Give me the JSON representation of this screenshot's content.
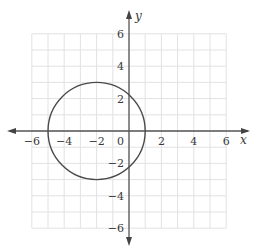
{
  "chart_data": {
    "type": "line",
    "title": "",
    "xlabel": "x",
    "ylabel": "y",
    "xlim": [
      -6,
      6
    ],
    "ylim": [
      -6,
      6
    ],
    "grid": true,
    "x_ticks": [
      -6,
      -4,
      -2,
      0,
      2,
      4,
      6
    ],
    "y_ticks": [
      -6,
      -4,
      -2,
      2,
      4,
      6
    ],
    "x_tick_labels": [
      "−6",
      "−4",
      "−2",
      "0",
      "2",
      "4",
      "6"
    ],
    "y_tick_labels": [
      "−6",
      "−4",
      "−2",
      "2",
      "4",
      "6"
    ],
    "series": [
      {
        "name": "circle",
        "shape": "circle",
        "center": [
          -2,
          0
        ],
        "radius": 3,
        "equation": "(x + 2)^2 + y^2 = 9"
      }
    ]
  },
  "colors": {
    "grid": "#e2e2e2",
    "axis": "#555555",
    "curve": "#4a4a4a",
    "text": "#3a3a3a"
  }
}
